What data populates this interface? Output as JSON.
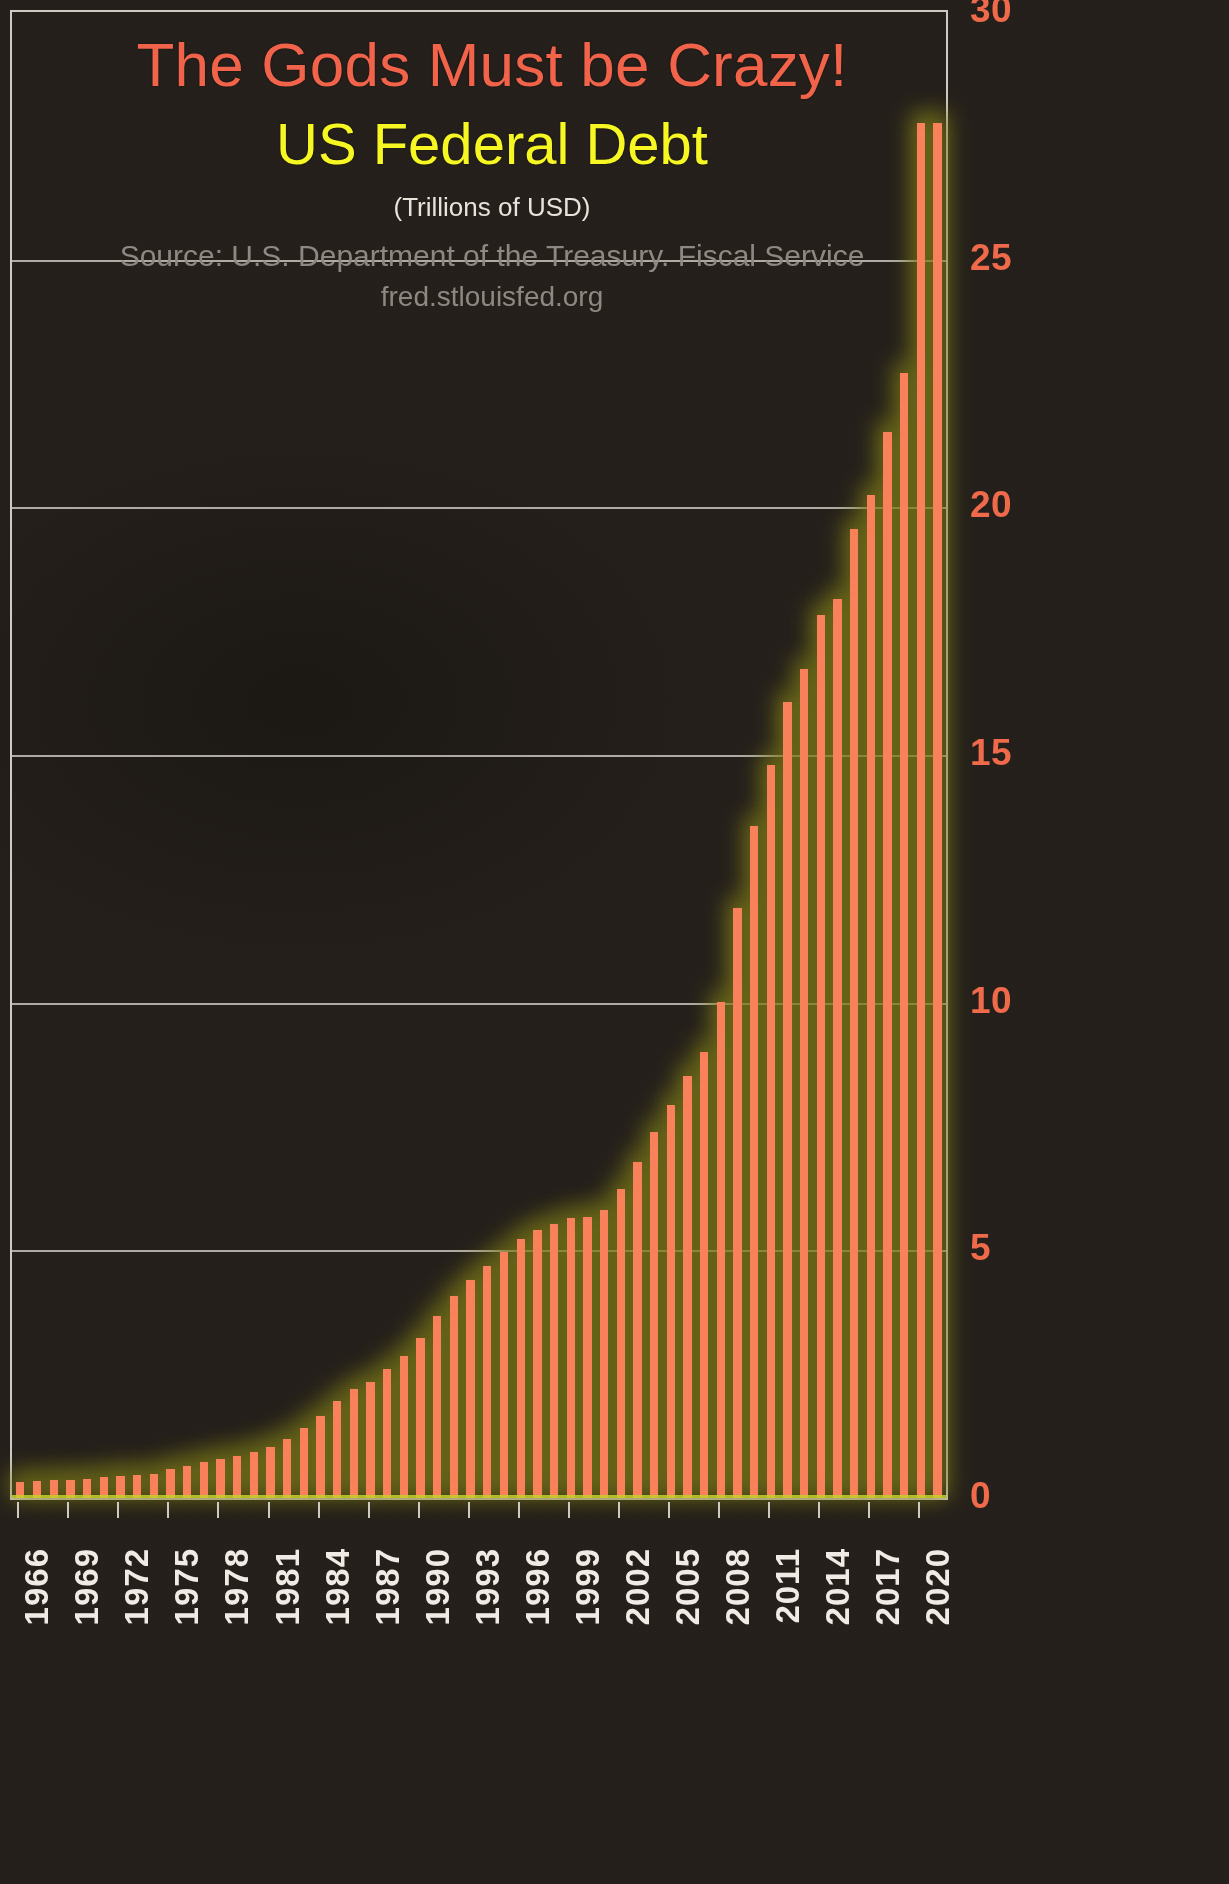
{
  "titles": {
    "main": "The Gods Must be Crazy!",
    "sub": "US Federal Debt",
    "units": "(Trillions of USD)",
    "source_line1": "Source: U.S. Department of the Treasury. Fiscal Service",
    "source_line2": "fred.stlouisfed.org"
  },
  "colors": {
    "background": "#262019",
    "bar": "#f9815a",
    "bar_glow": "#7c7a17",
    "title_main": "#f1634a",
    "title_sub": "#f7f723",
    "units": "#e8e4dc",
    "source": "#8e8880",
    "gridline": "#c9c4bc",
    "ytick": "#ef6a4a",
    "xtick": "#f0ece5",
    "baseline": "#c3d12a"
  },
  "chart_data": {
    "type": "bar",
    "title": "The Gods Must be Crazy! US Federal Debt",
    "subtitle": "(Trillions of USD)",
    "xlabel": "",
    "ylabel": "Trillions of USD",
    "ylim": [
      0,
      30
    ],
    "yticks": [
      0,
      5,
      10,
      15,
      20,
      25,
      30
    ],
    "ytick_labels": [
      "0",
      "5",
      "10",
      "15",
      "20",
      "25",
      "30"
    ],
    "grid": true,
    "legend": null,
    "xtick_labels": [
      "1966",
      "1969",
      "1972",
      "1975",
      "1978",
      "1981",
      "1984",
      "1987",
      "1990",
      "1993",
      "1996",
      "1999",
      "2002",
      "2005",
      "2008",
      "2011",
      "2014",
      "2017",
      "2020"
    ],
    "xtick_years": [
      1966,
      1969,
      1972,
      1975,
      1978,
      1981,
      1984,
      1987,
      1990,
      1993,
      1996,
      1999,
      2002,
      2005,
      2008,
      2011,
      2014,
      2017,
      2020
    ],
    "categories": [
      1966,
      1967,
      1968,
      1969,
      1970,
      1971,
      1972,
      1973,
      1974,
      1975,
      1976,
      1977,
      1978,
      1979,
      1980,
      1981,
      1982,
      1983,
      1984,
      1985,
      1986,
      1987,
      1988,
      1989,
      1990,
      1991,
      1992,
      1993,
      1994,
      1995,
      1996,
      1997,
      1998,
      1999,
      2000,
      2001,
      2002,
      2003,
      2004,
      2005,
      2006,
      2007,
      2008,
      2009,
      2010,
      2011,
      2012,
      2013,
      2014,
      2015,
      2016,
      2017,
      2018,
      2019,
      2020,
      2021
    ],
    "values": [
      0.32,
      0.34,
      0.37,
      0.37,
      0.39,
      0.42,
      0.45,
      0.47,
      0.49,
      0.58,
      0.65,
      0.72,
      0.79,
      0.85,
      0.93,
      1.03,
      1.2,
      1.41,
      1.66,
      1.95,
      2.21,
      2.35,
      2.6,
      2.87,
      3.23,
      3.67,
      4.07,
      4.41,
      4.69,
      4.97,
      5.22,
      5.41,
      5.53,
      5.66,
      5.67,
      5.81,
      6.23,
      6.78,
      7.38,
      7.93,
      8.51,
      9.01,
      10.02,
      11.91,
      13.56,
      14.79,
      16.07,
      16.74,
      17.82,
      18.15,
      19.57,
      20.24,
      21.52,
      22.72,
      27.75,
      27.75
    ],
    "n_bars": 56,
    "year_start": 1966,
    "year_end": 2021,
    "annotations": [
      {
        "text": "Source: U.S. Department of the Treasury. Fiscal Service",
        "position": "top-center"
      },
      {
        "text": "fred.stlouisfed.org",
        "position": "top-center"
      }
    ]
  }
}
